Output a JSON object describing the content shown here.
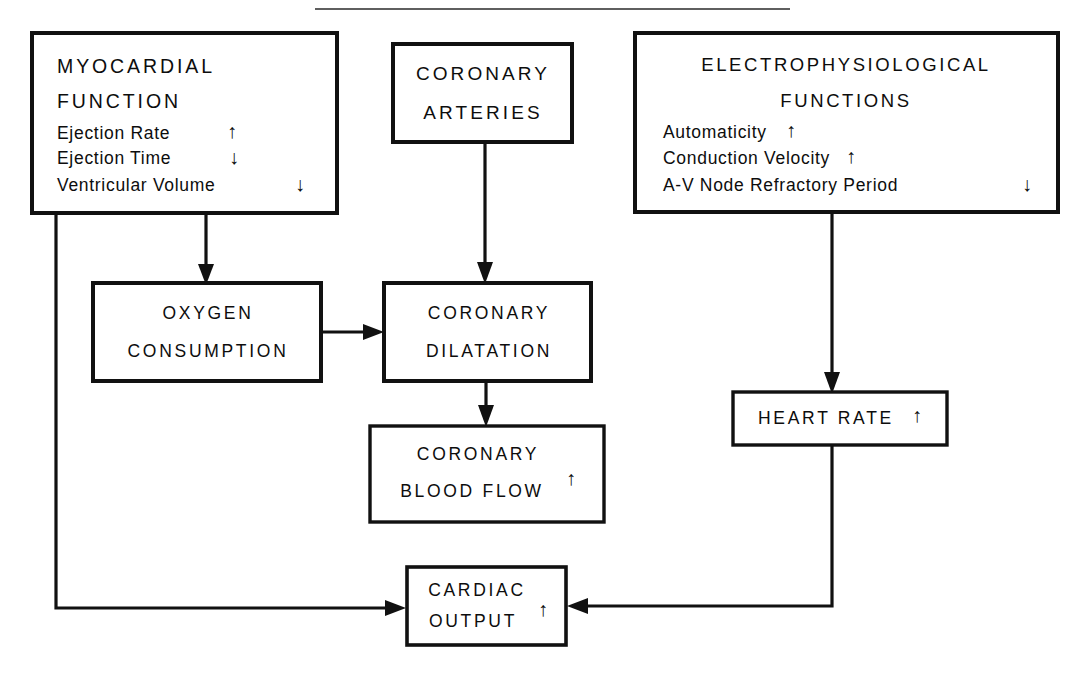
{
  "diagram": {
    "title_rule": "horizontal-rule",
    "arrow_up_glyph": "⬆",
    "arrow_down_glyph": "⬇",
    "nodes": {
      "myocardial": {
        "heading_line1": "MYOCARDIAL",
        "heading_line2": "FUNCTION",
        "items": [
          {
            "label": "Ejection Rate",
            "change": "↑"
          },
          {
            "label": "Ejection Time",
            "change": "↓"
          },
          {
            "label": "Ventricular Volume",
            "change": "↓"
          }
        ]
      },
      "coronary_arteries": {
        "line1": "CORONARY",
        "line2": "ARTERIES"
      },
      "electrophysiological": {
        "heading_line1": "ELECTROPHYSIOLOGICAL",
        "heading_line2": "FUNCTIONS",
        "items": [
          {
            "label": "Automaticity",
            "change": "↑"
          },
          {
            "label": "Conduction Velocity",
            "change": "↑"
          },
          {
            "label": "A-V Node Refractory Period",
            "change": "↓"
          }
        ]
      },
      "oxygen_consumption": {
        "line1": "OXYGEN",
        "line2": "CONSUMPTION"
      },
      "coronary_dilatation": {
        "line1": "CORONARY",
        "line2": "DILATATION"
      },
      "coronary_blood_flow": {
        "line1": "CORONARY",
        "line2": "BLOOD FLOW",
        "change": "↑"
      },
      "heart_rate": {
        "line1": "HEART RATE",
        "change": "↑"
      },
      "cardiac_output": {
        "line1": "CARDIAC",
        "line2": "OUTPUT",
        "change": "↑"
      }
    },
    "edges": [
      {
        "name": "myocardial-to-oxygen-consumption",
        "from": "myocardial",
        "to": "oxygen_consumption"
      },
      {
        "name": "myocardial-to-cardiac-output",
        "from": "myocardial",
        "to": "cardiac_output"
      },
      {
        "name": "coronary-arteries-to-coronary-dilatation",
        "from": "coronary_arteries",
        "to": "coronary_dilatation"
      },
      {
        "name": "oxygen-consumption-to-coronary-dilatation",
        "from": "oxygen_consumption",
        "to": "coronary_dilatation"
      },
      {
        "name": "coronary-dilatation-to-coronary-blood-flow",
        "from": "coronary_dilatation",
        "to": "coronary_blood_flow"
      },
      {
        "name": "electrophysiological-to-heart-rate",
        "from": "electrophysiological",
        "to": "heart_rate"
      },
      {
        "name": "heart-rate-to-cardiac-output",
        "from": "heart_rate",
        "to": "cardiac_output"
      }
    ],
    "colors": {
      "ink": "#111111",
      "paper": "#ffffff"
    }
  }
}
